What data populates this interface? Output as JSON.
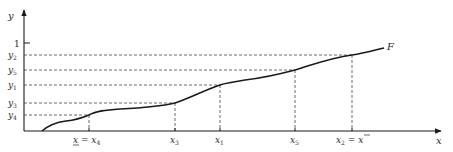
{
  "diagram": {
    "type": "cumulative-distribution-step-plot",
    "curve_label": "F",
    "axes": {
      "x_label": "x",
      "y_label": "y",
      "y_tick_one": "1"
    },
    "y_levels": [
      {
        "name": "y2",
        "base": "y",
        "sub": "2",
        "py": 55
      },
      {
        "name": "y5",
        "base": "y",
        "sub": "5",
        "py": 70
      },
      {
        "name": "y1",
        "base": "y",
        "sub": "1",
        "py": 85
      },
      {
        "name": "y3",
        "base": "y",
        "sub": "3",
        "py": 103
      },
      {
        "name": "y4",
        "base": "y",
        "sub": "4",
        "py": 115
      }
    ],
    "x_points": [
      {
        "name": "x4",
        "label": "x̲ = x",
        "sub": "4",
        "px": 89
      },
      {
        "name": "x3",
        "label": "x",
        "sub": "3",
        "px": 175
      },
      {
        "name": "x1",
        "label": "x",
        "sub": "1",
        "px": 220
      },
      {
        "name": "x5",
        "label": "x",
        "sub": "5",
        "px": 295
      },
      {
        "name": "x2",
        "label": "x",
        "sub": "2",
        "suffix": " = x̄",
        "px": 352
      }
    ],
    "colors": {
      "line": "#1a1a1a",
      "dash": "#444444",
      "text": "#2a2a2a"
    }
  }
}
